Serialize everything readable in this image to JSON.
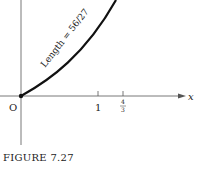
{
  "figure": {
    "caption": "FIGURE 7.27",
    "curve_label": "Length = 56/27",
    "origin_label": "O",
    "x_axis_label": "x",
    "ticks": [
      {
        "label": "1",
        "value": 1
      },
      {
        "label_num": "4",
        "label_den": "3",
        "value": 1.3333
      }
    ]
  },
  "colors": {
    "ink": "#222222",
    "background": "#ffffff"
  }
}
